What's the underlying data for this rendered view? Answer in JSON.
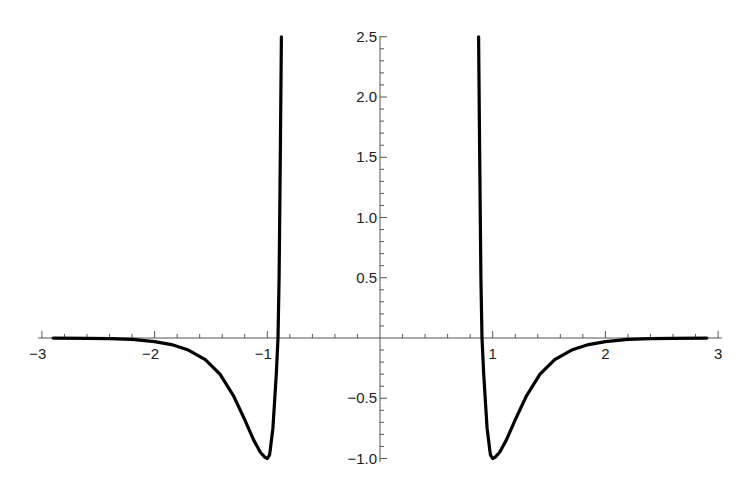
{
  "chart_data": {
    "type": "line",
    "title": "",
    "xlabel": "",
    "ylabel": "",
    "xlim": [
      -3,
      3
    ],
    "ylim": [
      -1.0,
      2.5
    ],
    "grid": false,
    "legend": null,
    "x_ticks": [
      -3,
      -2,
      -1,
      1,
      2,
      3
    ],
    "x_tick_labels": [
      "−3",
      "−2",
      "−1",
      "1",
      "2",
      "3"
    ],
    "y_ticks": [
      2.5,
      2.0,
      1.5,
      1.0,
      0.5,
      -0.5,
      -1.0
    ],
    "y_tick_labels": [
      "2.5",
      "2.0",
      "1.5",
      "1.0",
      "0.5",
      "−0.5",
      "−1.0"
    ],
    "series": [
      {
        "name": "left-branch",
        "x": [
          -2.9,
          -2.6,
          -2.4,
          -2.2,
          -2.0,
          -1.85,
          -1.7,
          -1.55,
          -1.42,
          -1.3,
          -1.2,
          -1.12,
          -1.06,
          -1.02,
          -1.0,
          -0.98,
          -0.95,
          -0.92,
          -0.905,
          -0.895,
          -0.885,
          -0.875
        ],
        "y": [
          -0.001,
          -0.003,
          -0.006,
          -0.012,
          -0.03,
          -0.055,
          -0.1,
          -0.18,
          -0.3,
          -0.48,
          -0.68,
          -0.85,
          -0.95,
          -0.99,
          -1.0,
          -0.97,
          -0.75,
          -0.3,
          0.0,
          0.5,
          1.5,
          2.5
        ]
      },
      {
        "name": "right-branch",
        "x": [
          0.875,
          0.885,
          0.895,
          0.905,
          0.92,
          0.95,
          0.98,
          1.0,
          1.02,
          1.06,
          1.12,
          1.2,
          1.3,
          1.42,
          1.55,
          1.7,
          1.85,
          2.0,
          2.2,
          2.4,
          2.6,
          2.9
        ],
        "y": [
          2.5,
          1.5,
          0.5,
          0.0,
          -0.3,
          -0.75,
          -0.97,
          -1.0,
          -0.99,
          -0.95,
          -0.85,
          -0.68,
          -0.48,
          -0.3,
          -0.18,
          -0.1,
          -0.055,
          -0.03,
          -0.012,
          -0.006,
          -0.003,
          -0.001
        ]
      }
    ]
  }
}
